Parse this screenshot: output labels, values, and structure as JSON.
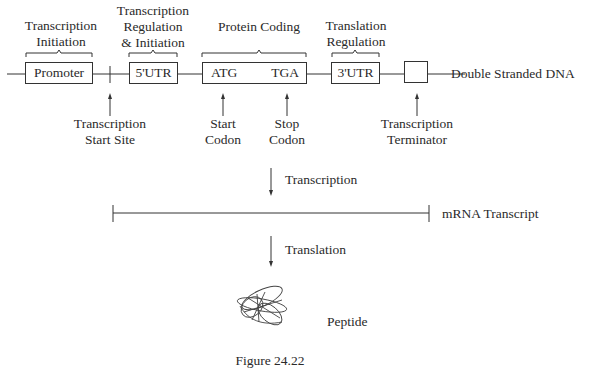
{
  "diagram": {
    "region_labels": {
      "transcription_initiation": [
        "Transcription",
        "Initiation"
      ],
      "transcription_regulation": [
        "Transcription",
        "Regulation",
        "& Initiation"
      ],
      "protein_coding": [
        "Protein Coding"
      ],
      "translation_regulation": [
        "Translation",
        "Regulation"
      ]
    },
    "boxes": {
      "promoter": "Promoter",
      "utr5": "5'UTR",
      "coding_start": "ATG",
      "coding_stop": "TGA",
      "utr3": "3'UTR",
      "terminator": ""
    },
    "dna_label": "Double Stranded DNA",
    "pointer_labels": {
      "tss": [
        "Transcription",
        "Start Site"
      ],
      "start_codon": [
        "Start",
        "Codon"
      ],
      "stop_codon": [
        "Stop",
        "Codon"
      ],
      "terminator": [
        "Transcription",
        "Terminator"
      ]
    },
    "steps": {
      "transcription": "Transcription",
      "translation": "Translation"
    },
    "mrna_label": "mRNA Transcript",
    "peptide_label": "Peptide",
    "caption": "Figure 24.22"
  },
  "colors": {
    "line": "#333333",
    "text": "#2a2a2a"
  }
}
